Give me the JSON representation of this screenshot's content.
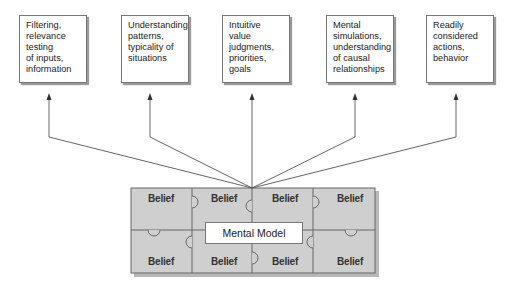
{
  "boxes": [
    {
      "lines": [
        "Filtering,",
        "relevance",
        "testing",
        "of inputs,",
        "information"
      ]
    },
    {
      "lines": [
        "Understanding",
        "patterns,",
        "typicality of",
        "situations"
      ]
    },
    {
      "lines": [
        "Intuitive value",
        "judgments,",
        "priorities, goals"
      ]
    },
    {
      "lines": [
        "Mental",
        "simulations,",
        "understanding",
        "of causal",
        "relationships"
      ]
    },
    {
      "lines": [
        "Readily",
        "considered",
        "actions,",
        "behavior"
      ]
    }
  ],
  "puzzle": {
    "piece_label": "Belief",
    "center_label": "Mental Model",
    "pieces_count": 8
  },
  "colors": {
    "puzzle_fill": "#cfcfcf",
    "puzzle_line": "#666666",
    "arrow": "#555555",
    "box_border": "#777777"
  }
}
